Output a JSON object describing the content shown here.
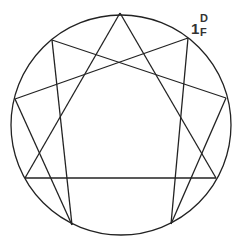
{
  "diagram": {
    "type": "nine-point star in circle",
    "stroke_color": "#222222",
    "background": "#ffffff",
    "circle": {
      "cx": 121,
      "cy": 125,
      "r": 110
    },
    "points": [
      {
        "id": "P0",
        "x": 120,
        "y": 13
      },
      {
        "id": "P1",
        "x": 188,
        "y": 38
      },
      {
        "id": "P2",
        "x": 226,
        "y": 98
      },
      {
        "id": "P3",
        "x": 216,
        "y": 178
      },
      {
        "id": "P4",
        "x": 171,
        "y": 224
      },
      {
        "id": "P5",
        "x": 72,
        "y": 225
      },
      {
        "id": "P6",
        "x": 25,
        "y": 178
      },
      {
        "id": "P7",
        "x": 15,
        "y": 99
      },
      {
        "id": "P8",
        "x": 52,
        "y": 40
      }
    ],
    "edges": [
      [
        "P0",
        "P6"
      ],
      [
        "P0",
        "P3"
      ],
      [
        "P8",
        "P2"
      ],
      [
        "P7",
        "P1"
      ],
      [
        "P6",
        "P3"
      ],
      [
        "P7",
        "P5"
      ],
      [
        "P8",
        "P5"
      ],
      [
        "P1",
        "P4"
      ],
      [
        "P2",
        "P4"
      ]
    ],
    "label": {
      "main": "1",
      "superscript": "D",
      "subscript": "F",
      "color": "#333333",
      "anchor_point": "P1"
    }
  }
}
